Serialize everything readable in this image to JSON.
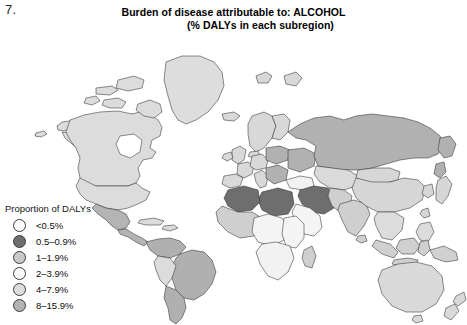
{
  "figure": {
    "number": "7."
  },
  "title": {
    "line1": "Burden of disease attributable to: ALCOHOL",
    "line2": "(% DALYs in each subregion)"
  },
  "legend": {
    "heading": "Proportion of DALYs",
    "items": [
      {
        "label": "<0.5%",
        "color": "#ffffff"
      },
      {
        "label": "0.5–0.9%",
        "color": "#6e6e6e"
      },
      {
        "label": "1–1.9%",
        "color": "#c9c9c9"
      },
      {
        "label": "2–3.9%",
        "color": "#fbfbfb"
      },
      {
        "label": "4–7.9%",
        "color": "#dddddd"
      },
      {
        "label": "8–15.9%",
        "color": "#b3b3b3"
      }
    ]
  },
  "map": {
    "projection": "world-equirectangular",
    "outline_color": "#2f2f2f",
    "background": "#ffffff",
    "regions": [
      {
        "name": "greenland",
        "bucket": "4-7.9%",
        "fill": "#dddddd"
      },
      {
        "name": "canada",
        "bucket": "4-7.9%",
        "fill": "#dcdcdc"
      },
      {
        "name": "alaska",
        "bucket": "4-7.9%",
        "fill": "#dcdcdc"
      },
      {
        "name": "united-states",
        "bucket": "4-7.9%",
        "fill": "#dcdcdc"
      },
      {
        "name": "mexico",
        "bucket": "8-15.9%",
        "fill": "#b4b4b4"
      },
      {
        "name": "central-america",
        "bucket": "8-15.9%",
        "fill": "#b4b4b4"
      },
      {
        "name": "caribbean",
        "bucket": "4-7.9%",
        "fill": "#dcdcdc"
      },
      {
        "name": "brazil",
        "bucket": "8-15.9%",
        "fill": "#b0b0b0"
      },
      {
        "name": "andean-region",
        "bucket": "4-7.9%",
        "fill": "#dcdcdc"
      },
      {
        "name": "southern-cone",
        "bucket": "8-15.9%",
        "fill": "#b0b0b0"
      },
      {
        "name": "russia",
        "bucket": "8-15.9%",
        "fill": "#b1b1b1"
      },
      {
        "name": "scandinavia",
        "bucket": "4-7.9%",
        "fill": "#d8d8d8"
      },
      {
        "name": "western-europe",
        "bucket": "4-7.9%",
        "fill": "#d9d9d9"
      },
      {
        "name": "eastern-europe",
        "bucket": "8-15.9%",
        "fill": "#b1b1b1"
      },
      {
        "name": "turkey",
        "bucket": "2-3.9%",
        "fill": "#f2f2f2"
      },
      {
        "name": "north-africa",
        "bucket": "0.5-0.9%",
        "fill": "#6e6e6e"
      },
      {
        "name": "middle-east",
        "bucket": "0.5-0.9%",
        "fill": "#6e6e6e"
      },
      {
        "name": "west-africa",
        "bucket": "1-1.9%",
        "fill": "#cfcfcf"
      },
      {
        "name": "central-africa",
        "bucket": "2-3.9%",
        "fill": "#f4f4f4"
      },
      {
        "name": "east-africa",
        "bucket": "2-3.9%",
        "fill": "#f4f4f4"
      },
      {
        "name": "southern-africa",
        "bucket": "2-3.9%",
        "fill": "#f2f2f2"
      },
      {
        "name": "central-asia",
        "bucket": "4-7.9%",
        "fill": "#dadada"
      },
      {
        "name": "india",
        "bucket": "1-1.9%",
        "fill": "#cfcfcf"
      },
      {
        "name": "china",
        "bucket": "4-7.9%",
        "fill": "#d6d6d6"
      },
      {
        "name": "mongolia",
        "bucket": "4-7.9%",
        "fill": "#d6d6d6"
      },
      {
        "name": "korea-japan",
        "bucket": "4-7.9%",
        "fill": "#d6d6d6"
      },
      {
        "name": "southeast-asia",
        "bucket": "4-7.9%",
        "fill": "#dcdcdc"
      },
      {
        "name": "indonesia",
        "bucket": "1-1.9%",
        "fill": "#d0d0d0"
      },
      {
        "name": "australia",
        "bucket": "4-7.9%",
        "fill": "#d9d9d9"
      },
      {
        "name": "new-zealand",
        "bucket": "4-7.9%",
        "fill": "#d9d9d9"
      }
    ]
  }
}
